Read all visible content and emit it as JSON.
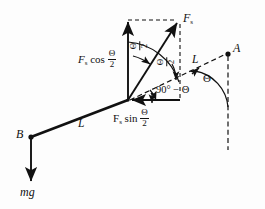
{
  "figure": {
    "background_color": "#fdfdfd",
    "stroke_color": "#111111",
    "points": {
      "A": "A",
      "B": "B"
    },
    "labels": {
      "spring_force": "F",
      "spring_force_sub": "s",
      "cos_component_lead": "F",
      "cos_component_sub": "s",
      "cos_component_fn": "cos",
      "sin_component_lead": "F",
      "sin_component_sub": "s",
      "sin_component_fn": "sin",
      "rod_length_left": "L",
      "rod_length_right": "L",
      "weight": "mg",
      "angle_complement": "90° − Θ",
      "angle_theta": "Θ",
      "half_angle_numerator": "Θ",
      "half_angle_denominator": "2"
    },
    "angles": [
      {
        "name": "half-angle-upper-left",
        "value": "Θ/2"
      },
      {
        "name": "half-angle-upper-right",
        "value": "Θ/2"
      },
      {
        "name": "half-angle-cos-label",
        "value": "Θ/2"
      },
      {
        "name": "half-angle-sin-label",
        "value": "Θ/2"
      },
      {
        "name": "complement-angle",
        "value": "90° − Θ"
      },
      {
        "name": "theta-angle-right",
        "value": "Θ"
      }
    ],
    "vectors": [
      {
        "name": "spring-force",
        "label": "F_s",
        "from": "vertex",
        "to": "upper-right",
        "style": "solid"
      },
      {
        "name": "cos-component",
        "label": "F_s cos Θ/2",
        "from": "vertex",
        "to": "up",
        "style": "solid"
      },
      {
        "name": "sin-component",
        "label": "F_s sin Θ/2",
        "from": "right",
        "to": "vertex",
        "style": "solid"
      },
      {
        "name": "weight",
        "label": "mg",
        "from": "B",
        "to": "down",
        "style": "solid"
      }
    ],
    "segments": [
      {
        "name": "rod-B-to-vertex",
        "label": "L",
        "style": "solid-thick"
      },
      {
        "name": "rod-vertex-to-A",
        "label": "L",
        "style": "dashed"
      },
      {
        "name": "vertical-reference-A",
        "label": "",
        "style": "dashed"
      },
      {
        "name": "construction-top",
        "label": "",
        "style": "dashed"
      },
      {
        "name": "construction-right",
        "label": "",
        "style": "dashed"
      }
    ]
  }
}
